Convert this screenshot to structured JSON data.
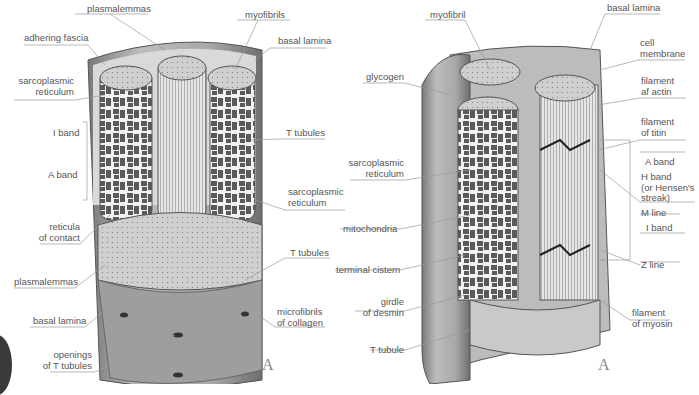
{
  "figure_left": {
    "panel_letter": "A",
    "labels": {
      "plasmalemmas_top": "plasmalemmas",
      "myofibrils": "myofibrils",
      "adhering_fascia": "adhering fascia",
      "basal_lamina_top": "basal lamina",
      "sarcoplasmic_reticulum_left_1": "sarcoplasmic",
      "sarcoplasmic_reticulum_left_2": "reticulum",
      "i_band": "I band",
      "a_band": "A band",
      "t_tubules_upper": "T tubules",
      "sarcoplasmic_reticulum_right_1": "sarcoplasmic",
      "sarcoplasmic_reticulum_right_2": "reticulum",
      "reticula_of_contact_1": "reticula",
      "reticula_of_contact_2": "of contact",
      "t_tubules_lower": "T tubules",
      "plasmalemmas_bottom": "plasmalemmas",
      "basal_lamina_bottom": "basal lamina",
      "microfibrils_1": "microfibrils",
      "microfibrils_2": "of collagen",
      "openings_1": "openings",
      "openings_2": "of T tubules"
    }
  },
  "figure_right": {
    "panel_letter": "A",
    "labels": {
      "myofibril": "myofibril",
      "basal_lamina": "basal lamina",
      "cell_membrane_1": "cell",
      "cell_membrane_2": "membrane",
      "glycogen": "glycogen",
      "filament_actin_1": "filament",
      "filament_actin_2": "af actin",
      "filament_titin_1": "filament",
      "filament_titin_2": "of titin",
      "sarcoplasmic_reticulum_1": "sarcoplasmic",
      "sarcoplasmic_reticulum_2": "reticulum",
      "a_band": "A band",
      "h_band_1": "H band",
      "h_band_2": "(or Hensen's",
      "h_band_3": "streak)",
      "m_line": "M line",
      "mitochondria": "mitochondria",
      "i_band": "I band",
      "terminal_cistern": "terminal cistern",
      "z_line": "Z line",
      "girdle_1": "girdle",
      "girdle_2": "of desmin",
      "filament_myosin_1": "filament",
      "filament_myosin_2": "of myosin",
      "t_tubule": "T tubule"
    }
  }
}
